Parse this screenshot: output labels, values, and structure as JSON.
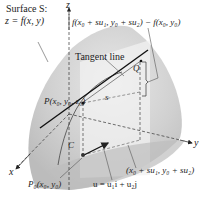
{
  "diagram": {
    "type": "3d-surface-directional-derivative",
    "labels": {
      "surface_line1": "Surface S:",
      "surface_line2": "z = f(x, y)",
      "z_axis": "z",
      "x_axis": "x",
      "y_axis": "y",
      "difference": "f(x₀ + su₁, y₀ + su₂) − f(x₀, y₀)",
      "tangent_line": "Tangent line",
      "Q": "Q",
      "P": "P(x₀, y₀, z₀)",
      "s": "s",
      "C": "C",
      "P0": "P₀(x₀, y₀)",
      "shifted_point": "(x₀ + su₁, y₀ + su₂)",
      "unit_vector": "u = u₁i + u₂j"
    },
    "colors": {
      "surface_dark": "#b9b9b9",
      "surface_mid": "#d2d2d2",
      "surface_light": "#e6e6e6",
      "plane_light": "#f0f0f0",
      "line": "#222222",
      "axis": "#333333"
    }
  }
}
